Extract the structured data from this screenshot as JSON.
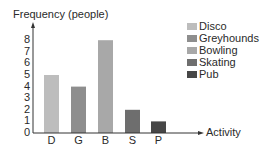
{
  "chart_data": {
    "type": "bar",
    "title": "",
    "ylabel": "Frequency (people)",
    "xlabel": "Activity",
    "categories": [
      "D",
      "G",
      "B",
      "S",
      "P"
    ],
    "values": [
      5,
      4,
      8,
      2,
      1
    ],
    "colors": [
      "#bdbdbd",
      "#8e8e8e",
      "#a8a8a8",
      "#6e6e6e",
      "#474747"
    ],
    "ylim": [
      0,
      8
    ],
    "yticks": [
      0,
      1,
      2,
      3,
      4,
      5,
      6,
      7,
      8
    ],
    "grid": false,
    "legend_position": "top-right",
    "legend": [
      {
        "label": "Disco",
        "color": "#bdbdbd"
      },
      {
        "label": "Greyhounds",
        "color": "#8e8e8e"
      },
      {
        "label": "Bowling",
        "color": "#a8a8a8"
      },
      {
        "label": "Skating",
        "color": "#6e6e6e"
      },
      {
        "label": "Pub",
        "color": "#474747"
      }
    ]
  }
}
